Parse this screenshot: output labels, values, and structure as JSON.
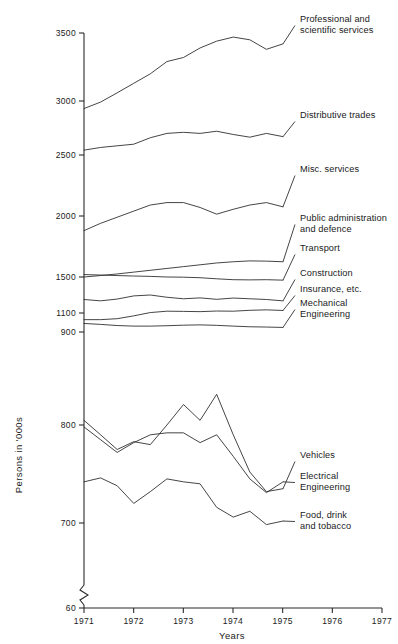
{
  "chart_data": {
    "type": "line",
    "title": "",
    "xlabel": "Years",
    "ylabel": "Persons in '000s",
    "x": [
      1971,
      1971.5,
      1972,
      1972.5,
      1973,
      1973.5,
      1974,
      1974.5,
      1975,
      1975.5,
      1976,
      1976.5,
      1977
    ],
    "xlim": [
      1971,
      1977
    ],
    "xticks": [
      "1971",
      "1972",
      "1973",
      "1974",
      "1975",
      "1976",
      "1977"
    ],
    "yticks": [
      "3500",
      "3000",
      "2500",
      "2000",
      "1500",
      "1100",
      "900",
      "800",
      "700",
      "60"
    ],
    "ytick_values": [
      3500,
      3000,
      2500,
      2000,
      1500,
      1100,
      900,
      800,
      700,
      60
    ],
    "axis_break": true,
    "axis_break_note": "zigzag break on y-axis between 700 and 60",
    "grid": false,
    "legend_position": "right-inline-labels",
    "series": [
      {
        "name": "Professional and scientific services",
        "label_lines": [
          "Professional and",
          "scientific services"
        ],
        "values": [
          2930,
          2990,
          3060,
          3130,
          3200,
          3290,
          3320,
          3390,
          3440,
          3470,
          3450,
          3380,
          3420
        ]
      },
      {
        "name": "Distributive trades",
        "label_lines": [
          "Distributive trades"
        ],
        "values": [
          2545,
          2570,
          2585,
          2600,
          2660,
          2700,
          2710,
          2700,
          2720,
          2690,
          2665,
          2700,
          2670
        ]
      },
      {
        "name": "Misc. services",
        "label_lines": [
          "Misc. services"
        ],
        "values": [
          1880,
          1940,
          1990,
          2040,
          2090,
          2110,
          2110,
          2070,
          2015,
          2055,
          2090,
          2110,
          2075
        ]
      },
      {
        "name": "Public administration and defence",
        "label_lines": [
          "Public administration",
          "and defence"
        ],
        "values": [
          1500,
          1512,
          1525,
          1540,
          1555,
          1570,
          1585,
          1600,
          1615,
          1625,
          1632,
          1630,
          1625
        ]
      },
      {
        "name": "Transport",
        "label_lines": [
          "Transport"
        ],
        "values": [
          1520,
          1516,
          1512,
          1508,
          1505,
          1500,
          1498,
          1492,
          1480,
          1470,
          1468,
          1470,
          1465
        ]
      },
      {
        "name": "Construction",
        "label_lines": [
          "Construction"
        ],
        "values": [
          1250,
          1235,
          1255,
          1290,
          1300,
          1275,
          1258,
          1268,
          1252,
          1266,
          1258,
          1250,
          1235
        ]
      },
      {
        "name": "Insurance, etc.",
        "label_lines": [
          "Insurance, etc."
        ],
        "values": [
          1030,
          1030,
          1040,
          1070,
          1105,
          1120,
          1118,
          1115,
          1122,
          1120,
          1130,
          1135,
          1128
        ]
      },
      {
        "name": "Mechanical Engineering",
        "label_lines": [
          "Mechanical",
          "Engineering"
        ],
        "values": [
          990,
          980,
          968,
          962,
          962,
          966,
          972,
          975,
          970,
          962,
          955,
          952,
          948
        ]
      },
      {
        "name": "Vehicles",
        "label_lines": [
          "Vehicles"
        ],
        "values": [
          805,
          790,
          775,
          783,
          780,
          800,
          822,
          805,
          833,
          790,
          752,
          732,
          735
        ]
      },
      {
        "name": "Electrical Engineering",
        "label_lines": [
          "Electrical",
          "Engineering"
        ],
        "values": [
          798,
          785,
          772,
          782,
          790,
          792,
          792,
          782,
          790,
          768,
          745,
          731,
          742
        ]
      },
      {
        "name": "Food, drink and tobacco",
        "label_lines": [
          "Food, drink",
          "and tobacco"
        ],
        "values": [
          742,
          746,
          738,
          720,
          732,
          745,
          742,
          740,
          716,
          706,
          712,
          688,
          702
        ]
      }
    ]
  },
  "axis": {
    "y_title": "Persons in '000s",
    "x_title": "Years"
  },
  "colors": {
    "line": "#303030",
    "axis": "#2b2b2b",
    "background": "#ffffff",
    "text": "#1a1a1a"
  }
}
